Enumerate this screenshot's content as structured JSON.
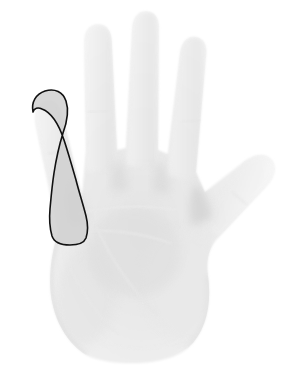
{
  "image": {
    "kind": "photograph",
    "subject": "open-left-hand-palm",
    "view": "palmar",
    "width": 293,
    "height": 368,
    "background_color": "#ffffff",
    "palette": {
      "background": "#ffffff",
      "skin_highlight": "#fbfbfb",
      "skin_base": "#f0f0f0",
      "skin_mid": "#e6e6e6",
      "skin_shadow": "#d9d9d9",
      "crease_line": "#dcdcdc",
      "annotation_stroke": "#111111",
      "annotation_fill": "#d0d0d0"
    }
  },
  "annotation": {
    "type": "outlined-region",
    "label": "ring-finger",
    "digit_number": "4",
    "stroke_color": "#111111",
    "stroke_width": "1.6",
    "fill_color": "#d0d0d0",
    "fill_opacity": "0.85",
    "closed": "true"
  },
  "anatomy": {
    "digits": [
      {
        "name": "little-finger",
        "digit": "5",
        "annotated": "false"
      },
      {
        "name": "ring-finger",
        "digit": "4",
        "annotated": "true"
      },
      {
        "name": "middle-finger",
        "digit": "3",
        "annotated": "false"
      },
      {
        "name": "index-finger",
        "digit": "2",
        "annotated": "false"
      },
      {
        "name": "thumb",
        "digit": "1",
        "annotated": "false"
      }
    ],
    "regions": [
      {
        "name": "palm"
      },
      {
        "name": "thenar-eminence"
      },
      {
        "name": "hypothenar-eminence"
      },
      {
        "name": "wrist"
      }
    ],
    "creases": [
      {
        "name": "distal-transverse-crease"
      },
      {
        "name": "proximal-transverse-crease"
      },
      {
        "name": "thenar-crease"
      }
    ]
  }
}
